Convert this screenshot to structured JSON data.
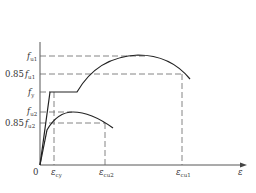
{
  "diagram": {
    "type": "stress-strain curve",
    "axes": {
      "origin_label": "0",
      "x_axis_label": "ε",
      "y_axis_label": ""
    },
    "y_ticks": [
      {
        "prefix": "",
        "sym": "f",
        "sub": "u1",
        "y": 56
      },
      {
        "prefix": "0.85",
        "sym": "f",
        "sub": "u1",
        "y": 74
      },
      {
        "prefix": "",
        "sym": "f",
        "sub": "y",
        "y": 92
      },
      {
        "prefix": "",
        "sym": "f",
        "sub": "u2",
        "y": 112
      },
      {
        "prefix": "0.85",
        "sym": "f",
        "sub": "u2",
        "y": 123
      }
    ],
    "x_ticks": [
      {
        "sym": "ε",
        "sub": "cy",
        "x": 54
      },
      {
        "sym": "ε",
        "sub": "cu2",
        "x": 105
      },
      {
        "sym": "ε",
        "sub": "cu1",
        "x": 182
      }
    ],
    "curves": [
      {
        "name": "curve-1",
        "description": "linear rise to f_y, plateau, then parabolic rise to f_u1 and descent to 0.85 f_u1 at ε_cu1"
      },
      {
        "name": "curve-2",
        "description": "linear rise then parabolic curve to f_u2 and descent to 0.85 f_u2 at ε_cu2"
      }
    ],
    "caption": ""
  }
}
